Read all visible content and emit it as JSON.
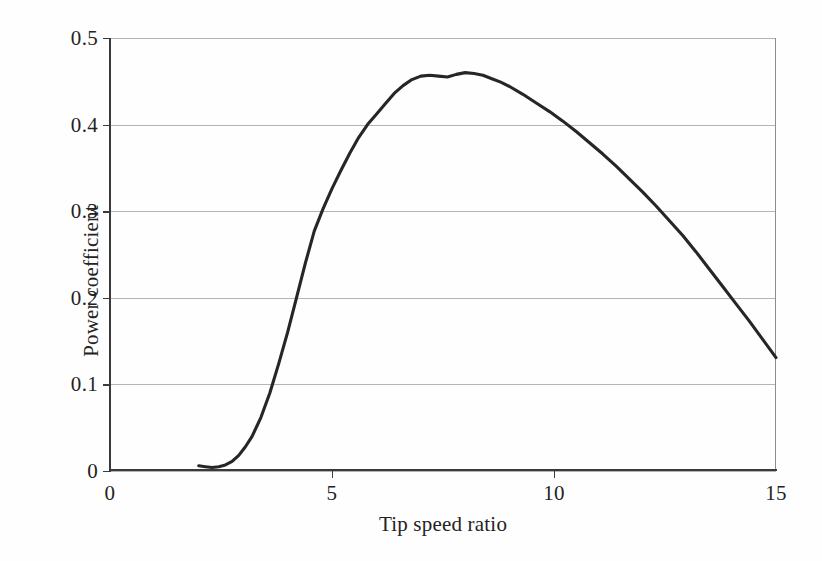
{
  "chart_data": {
    "type": "line",
    "title": "",
    "xlabel": "Tip speed ratio",
    "ylabel": "Power coefficient",
    "xlim": [
      0,
      15
    ],
    "ylim": [
      0,
      0.5
    ],
    "xticks": [
      "0",
      "5",
      "10",
      "15"
    ],
    "xtick_values": [
      0,
      5,
      10,
      15
    ],
    "yticks": [
      "0",
      "0.1",
      "0.2",
      "0.3",
      "0.4",
      "0.5"
    ],
    "ytick_values": [
      0,
      0.1,
      0.2,
      0.3,
      0.4,
      0.5
    ],
    "grid": "horizontal",
    "legend": "none",
    "line_color": "#262626",
    "grid_color": "#b4b4b4",
    "axis_color": "#3a3a3a",
    "background_color": "#fefefe",
    "series": [
      {
        "name": "Power coefficient",
        "x": [
          2.0,
          2.15,
          2.3,
          2.45,
          2.6,
          2.75,
          2.9,
          3.05,
          3.2,
          3.4,
          3.6,
          3.8,
          4.0,
          4.2,
          4.4,
          4.6,
          4.8,
          5.0,
          5.2,
          5.4,
          5.6,
          5.8,
          6.0,
          6.2,
          6.4,
          6.6,
          6.8,
          7.0,
          7.2,
          7.4,
          7.6,
          7.8,
          8.0,
          8.2,
          8.4,
          8.6,
          8.8,
          9.0,
          9.3,
          9.6,
          9.9,
          10.2,
          10.5,
          10.8,
          11.1,
          11.4,
          11.7,
          12.0,
          12.3,
          12.6,
          12.9,
          13.2,
          13.5,
          13.8,
          14.1,
          14.4,
          14.7,
          15.0
        ],
        "y": [
          0.006,
          0.005,
          0.004,
          0.005,
          0.007,
          0.011,
          0.018,
          0.028,
          0.04,
          0.062,
          0.09,
          0.124,
          0.16,
          0.2,
          0.24,
          0.277,
          0.303,
          0.326,
          0.347,
          0.367,
          0.385,
          0.4,
          0.412,
          0.424,
          0.436,
          0.445,
          0.452,
          0.456,
          0.457,
          0.456,
          0.455,
          0.458,
          0.46,
          0.459,
          0.457,
          0.453,
          0.449,
          0.444,
          0.435,
          0.425,
          0.415,
          0.404,
          0.392,
          0.379,
          0.366,
          0.352,
          0.337,
          0.322,
          0.306,
          0.289,
          0.272,
          0.253,
          0.233,
          0.213,
          0.193,
          0.173,
          0.152,
          0.131
        ]
      }
    ]
  }
}
